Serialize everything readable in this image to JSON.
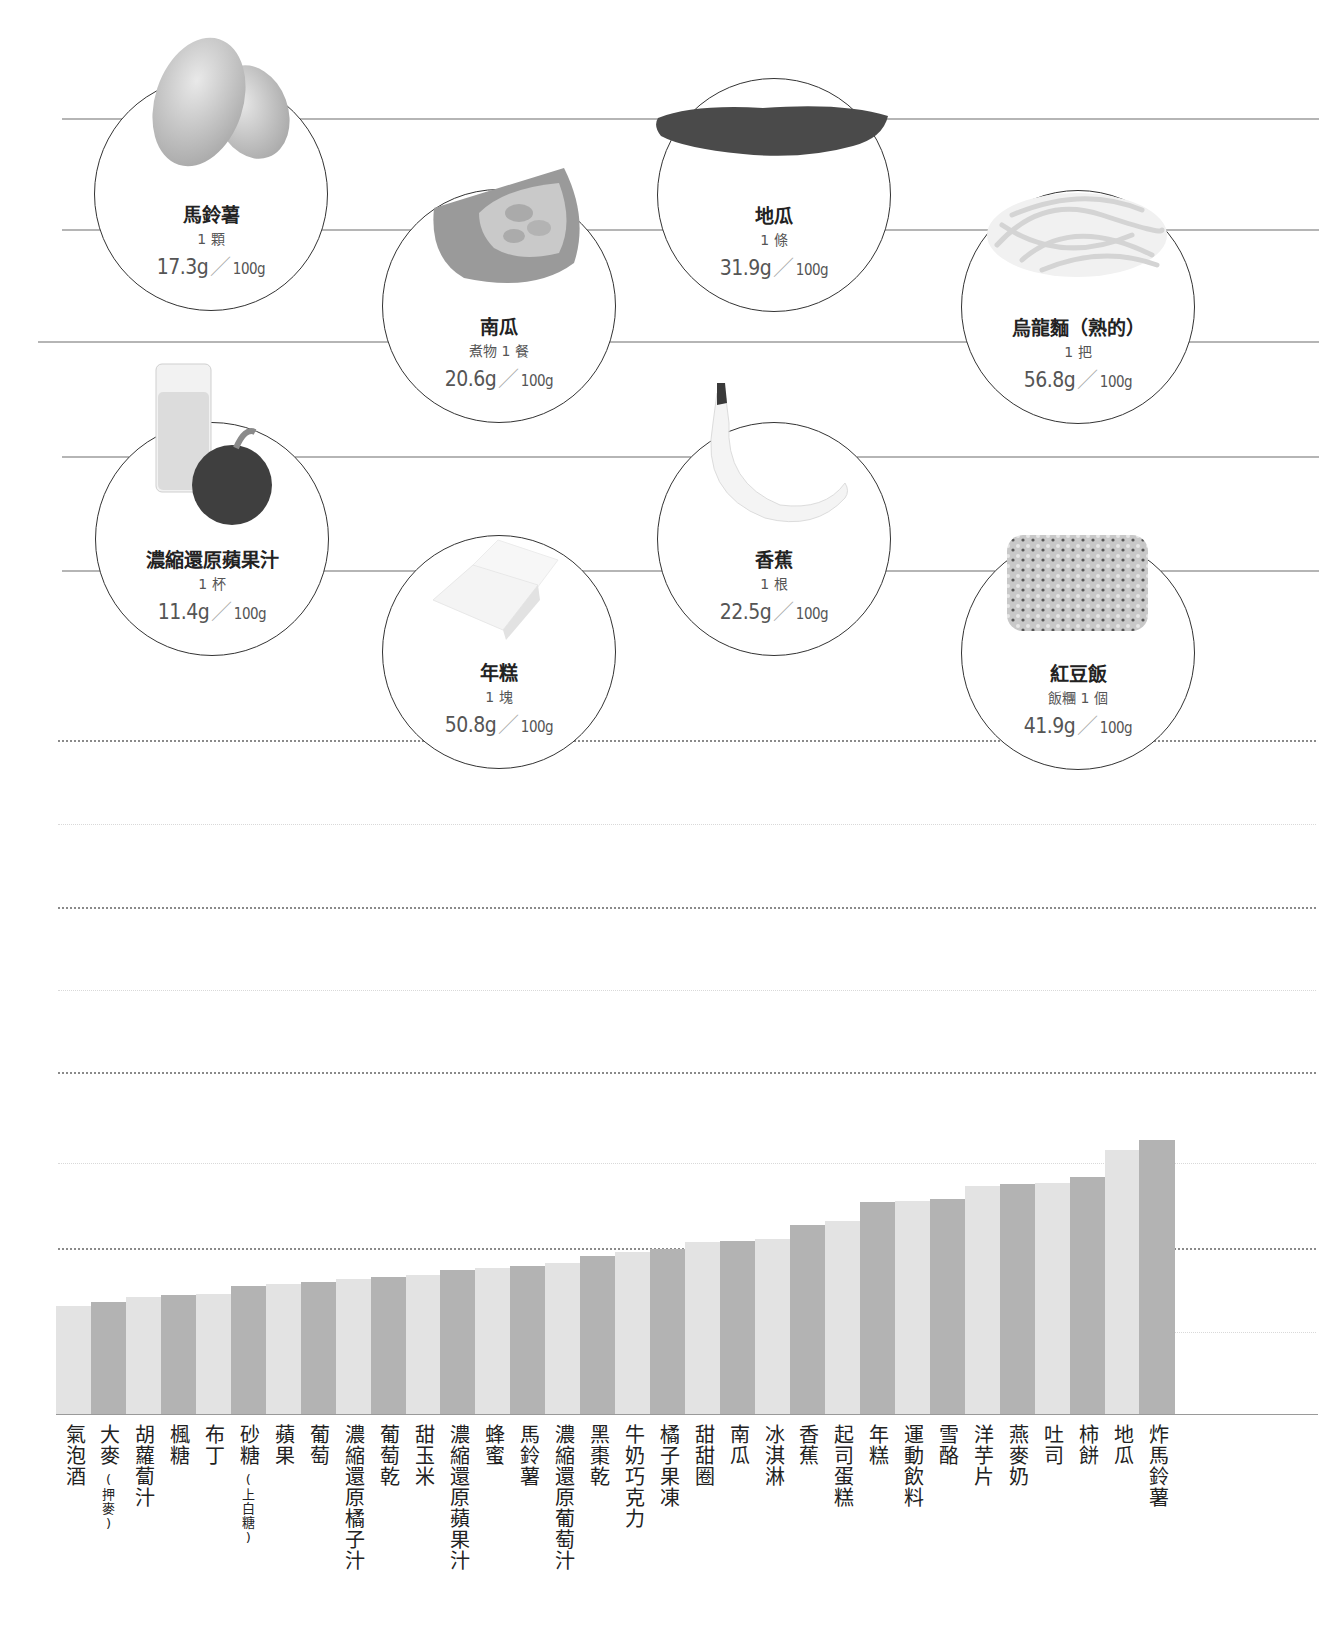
{
  "highlight_foods": [
    {
      "name": "馬鈴薯",
      "portion": "1 顆",
      "value": "17.3g",
      "per": "100g",
      "image": "potato"
    },
    {
      "name": "南瓜",
      "portion": "煮物 1 餐",
      "value": "20.6g",
      "per": "100g",
      "image": "pumpkin"
    },
    {
      "name": "地瓜",
      "portion": "1 條",
      "value": "31.9g",
      "per": "100g",
      "image": "sweet-potato"
    },
    {
      "name": "烏龍麵（熟的）",
      "portion": "1 把",
      "value": "56.8g",
      "per": "100g",
      "image": "udon-noodles"
    },
    {
      "name": "濃縮還原蘋果汁",
      "portion": "1 杯",
      "value": "11.4g",
      "per": "100g",
      "image": "apple-juice"
    },
    {
      "name": "年糕",
      "portion": "1 塊",
      "value": "50.8g",
      "per": "100g",
      "image": "rice-cake"
    },
    {
      "name": "香蕉",
      "portion": "1 根",
      "value": "22.5g",
      "per": "100g",
      "image": "banana"
    },
    {
      "name": "紅豆飯",
      "portion": "飯糰 1 個",
      "value": "41.9g",
      "per": "100g",
      "image": "red-bean-rice"
    }
  ],
  "separator": "／",
  "chart_data": {
    "type": "bar",
    "title": "",
    "xlabel": "",
    "ylabel": "",
    "ylim": [
      0,
      80
    ],
    "grid": true,
    "y_ticks_labeled": false,
    "note": "Y axis is unlabeled; values are relative estimates read from bar heights (one gridline interval = 20 units).",
    "categories": [
      "氣泡酒",
      "大麥(押麥)",
      "胡蘿蔔汁",
      "楓糖",
      "布丁",
      "砂糖(上白糖)",
      "蘋果",
      "葡萄",
      "濃縮還原橘子汁",
      "葡萄乾",
      "甜玉米",
      "濃縮還原蘋果汁",
      "蜂蜜",
      "馬鈴薯",
      "濃縮還原葡萄汁",
      "黑棗乾",
      "牛奶巧克力",
      "橘子果凍",
      "甜甜圈",
      "南瓜",
      "冰淇淋",
      "香蕉",
      "起司蛋糕",
      "年糕",
      "運動飲料",
      "雪酪",
      "洋芋片",
      "燕麥奶",
      "吐司",
      "柿餅",
      "地瓜",
      "炸馬鈴薯"
    ],
    "label_main": [
      "氣泡酒",
      "大麥",
      "胡蘿蔔汁",
      "楓糖",
      "布丁",
      "砂糖",
      "蘋果",
      "葡萄",
      "濃縮還原橘子汁",
      "葡萄乾",
      "甜玉米",
      "濃縮還原蘋果汁",
      "蜂蜜",
      "馬鈴薯",
      "濃縮還原葡萄汁",
      "黑棗乾",
      "牛奶巧克力",
      "橘子果凍",
      "甜甜圈",
      "南瓜",
      "冰淇淋",
      "香蕉",
      "起司蛋糕",
      "年糕",
      "運動飲料",
      "雪酪",
      "洋芋片",
      "燕麥奶",
      "吐司",
      "柿餅",
      "地瓜",
      "炸馬鈴薯"
    ],
    "label_note": [
      "",
      "(押麥)",
      "",
      "",
      "",
      "(上白糖)",
      "",
      "",
      "",
      "",
      "",
      "",
      "",
      "",
      "",
      "",
      "",
      "",
      "",
      "",
      "",
      "",
      "",
      "",
      "",
      "",
      "",
      "",
      "",
      "",
      "",
      ""
    ],
    "values": [
      25.7,
      26.7,
      27.9,
      28.3,
      28.6,
      30.5,
      30.9,
      31.4,
      32.1,
      32.6,
      33.1,
      34.3,
      34.8,
      35.2,
      35.9,
      37.6,
      38.6,
      39.3,
      41.0,
      41.2,
      41.7,
      45.0,
      46.0,
      50.5,
      50.7,
      51.2,
      54.3,
      54.8,
      55.0,
      56.4,
      62.9,
      65.2
    ],
    "bar_colors": [
      "#e3e3e3",
      "#b3b3b3"
    ]
  }
}
